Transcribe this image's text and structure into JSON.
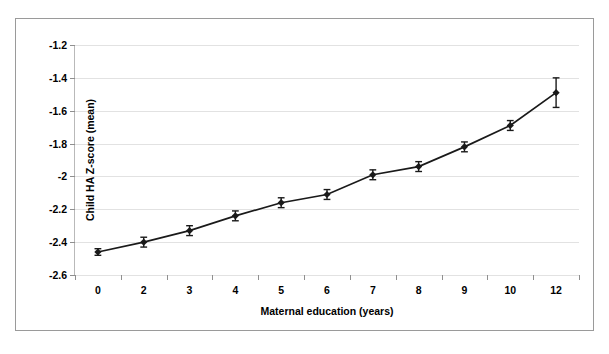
{
  "chart_data": {
    "type": "line",
    "title": "",
    "xlabel": "Maternal education (years)",
    "ylabel": "Child HA Z-score (mean)",
    "categories": [
      "0",
      "2",
      "3",
      "4",
      "5",
      "6",
      "7",
      "8",
      "9",
      "10",
      "12"
    ],
    "values": [
      -2.46,
      -2.4,
      -2.33,
      -2.24,
      -2.16,
      -2.11,
      -1.99,
      -1.94,
      -1.82,
      -1.69,
      -1.49
    ],
    "error_bars": [
      0.02,
      0.03,
      0.03,
      0.03,
      0.03,
      0.03,
      0.03,
      0.03,
      0.03,
      0.03,
      0.09
    ],
    "ylim": [
      -2.6,
      -1.2
    ],
    "yticks": [
      "-1.2",
      "-1.4",
      "-1.6",
      "-1.8",
      "-2",
      "-2.2",
      "-2.4",
      "-2.6"
    ],
    "ytick_values": [
      -1.2,
      -1.4,
      -1.6,
      -1.8,
      -2.0,
      -2.2,
      -2.4,
      -2.6
    ],
    "grid": true,
    "legend": "none",
    "marker": "diamond",
    "line_color": "#1a1a1a",
    "marker_color": "#1a1a1a",
    "grid_color": "#e2e2e2",
    "border_color": "#9a9a9a"
  }
}
